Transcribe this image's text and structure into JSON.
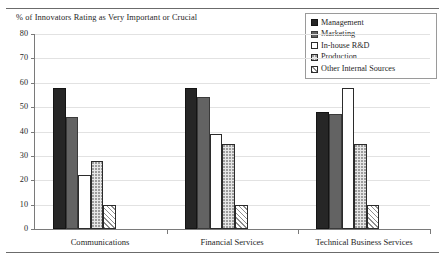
{
  "chart_data": {
    "type": "bar",
    "title": "% of Innovators Rating as Very Important or Crucial",
    "xlabel": "",
    "ylabel": "",
    "ylim": [
      0,
      80
    ],
    "yticks": [
      0,
      10,
      20,
      30,
      40,
      50,
      60,
      70,
      80
    ],
    "grid": true,
    "legend_position": "top-right",
    "categories": [
      "Communications",
      "Financial Services",
      "Technical Business Services"
    ],
    "series": [
      {
        "name": "Management",
        "values": [
          58,
          58,
          48
        ],
        "color": "#262626",
        "fill": "solid-dark"
      },
      {
        "name": "Marketing",
        "values": [
          46,
          54,
          47
        ],
        "color": "#636363",
        "fill": "solid-gray"
      },
      {
        "name": "In-house R&D",
        "values": [
          22,
          39,
          58
        ],
        "color": "#ffffff",
        "fill": "empty"
      },
      {
        "name": "Production",
        "values": [
          28,
          35,
          35
        ],
        "color": "#e7e7e7",
        "fill": "dotted"
      },
      {
        "name": "Other Internal Sources",
        "values": [
          10,
          10,
          10
        ],
        "color": "#ffffff",
        "fill": "diagonal-hatch"
      }
    ]
  },
  "legend": {
    "items": [
      {
        "label": "Management"
      },
      {
        "label": "Marketing"
      },
      {
        "label": "In-house R&D"
      },
      {
        "label": "Production"
      },
      {
        "label": "Other Internal Sources"
      }
    ]
  }
}
